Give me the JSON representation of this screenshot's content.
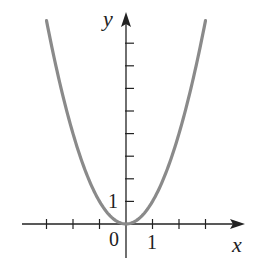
{
  "chart_data": {
    "type": "line",
    "title": "",
    "function": "y = x^2",
    "xlabel": "x",
    "ylabel": "y",
    "x_tick_labels": [
      "0",
      "1"
    ],
    "y_tick_labels": [
      "1"
    ],
    "x_ticks": [
      -3,
      -2,
      -1,
      1,
      2,
      3
    ],
    "y_ticks": [
      1,
      2,
      3,
      4,
      5,
      6,
      7,
      8
    ],
    "xlim": [
      -4,
      4.5
    ],
    "ylim": [
      -1.5,
      9.5
    ],
    "grid": false,
    "legend": null,
    "series": [
      {
        "name": "y = x^2",
        "color": "#8a8a8a",
        "x": [
          -3,
          -2.5,
          -2,
          -1.5,
          -1,
          -0.5,
          0,
          0.5,
          1,
          1.5,
          2,
          2.5,
          3
        ],
        "y": [
          9,
          6.25,
          4,
          2.25,
          1,
          0.25,
          0,
          0.25,
          1,
          2.25,
          4,
          6.25,
          9
        ]
      }
    ]
  },
  "labels": {
    "x_axis": "x",
    "y_axis": "y",
    "origin": "0",
    "x_one": "1",
    "y_one": "1"
  },
  "colors": {
    "axis": "#222222",
    "curve": "#8a8a8a"
  }
}
